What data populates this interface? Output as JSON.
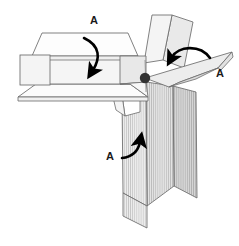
{
  "figure": {
    "background_color": "#ffffff",
    "outline_color": "#5a5a5a",
    "pivot_color": "#333333",
    "arrow_color": "#000000",
    "label_color": "#1a1a1a",
    "fills": {
      "panel_white": "#fdfdfd",
      "panel_light": "#f2f2f2",
      "panel_mid": "#e6e6e6",
      "panel_shaded": "#dcdcdc",
      "panel_dark": "#cfcfcf",
      "hatch_line": "#b5b5b5"
    },
    "labels": [
      {
        "id": "label-a-top",
        "text": "A",
        "x": 94,
        "y": 21
      },
      {
        "id": "label-a-right",
        "text": "A",
        "x": 220,
        "y": 74
      },
      {
        "id": "label-a-bottom",
        "text": "A",
        "x": 110,
        "y": 157
      }
    ],
    "arrows": [
      {
        "id": "arrow-top",
        "label": "A",
        "direction": "clockwise-down"
      },
      {
        "id": "arrow-right",
        "label": "A",
        "direction": "right-to-left-down"
      },
      {
        "id": "arrow-bottom",
        "label": "A",
        "direction": "left-to-right-up"
      }
    ],
    "pivot": {
      "id": "pivot-node",
      "x": 145,
      "y": 78,
      "radius": 5.2
    },
    "panels": [
      {
        "id": "top-left-box-top",
        "fill": "panel_white",
        "hatched": false
      },
      {
        "id": "top-left-box-front",
        "fill": "panel_light",
        "hatched": false
      },
      {
        "id": "top-left-side-flap",
        "fill": "panel_light",
        "hatched": false
      },
      {
        "id": "top-left-bottom-flap",
        "fill": "panel_white",
        "hatched": false
      },
      {
        "id": "upper-fin-left",
        "fill": "panel_light",
        "hatched": false
      },
      {
        "id": "upper-fin-right",
        "fill": "panel_mid",
        "hatched": false
      },
      {
        "id": "right-wing-panel",
        "fill": "panel_light",
        "hatched": false
      },
      {
        "id": "lower-panel-left",
        "fill": "panel_shaded",
        "hatched": true
      },
      {
        "id": "lower-panel-center",
        "fill": "panel_mid",
        "hatched": true
      },
      {
        "id": "lower-panel-right",
        "fill": "panel_dark",
        "hatched": true
      },
      {
        "id": "lower-panel-tab",
        "fill": "panel_shaded",
        "hatched": true
      }
    ]
  }
}
